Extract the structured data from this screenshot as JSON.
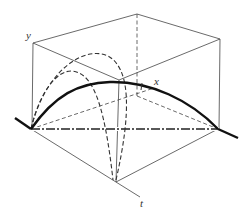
{
  "diagram": {
    "type": "3d-axes-trajectory",
    "colors": {
      "line": "#3a3a3a",
      "thick": "#111111",
      "background": "#ffffff"
    },
    "axes": {
      "y": {
        "label": "y"
      },
      "x": {
        "label": "x"
      },
      "t": {
        "label": "t"
      }
    },
    "curves": [
      {
        "name": "projection-xt-thick",
        "style": "solid-thick"
      },
      {
        "name": "large-dashed-arc",
        "style": "dashed"
      },
      {
        "name": "small-dashed-arc",
        "style": "dashed"
      },
      {
        "name": "base-dashdot-line",
        "style": "dash-dot"
      }
    ]
  }
}
